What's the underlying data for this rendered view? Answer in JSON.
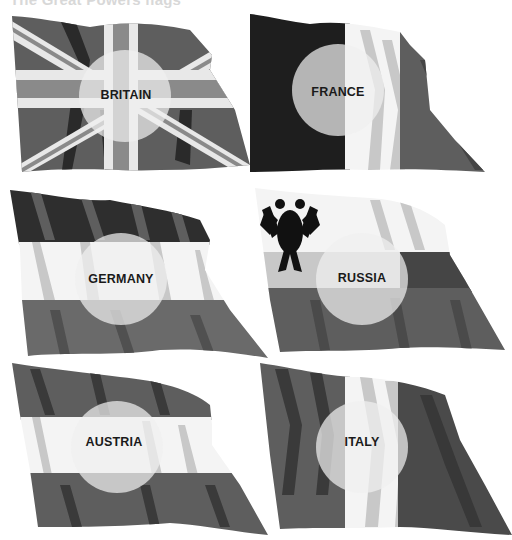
{
  "heading": "The Great Powers flags",
  "colors": {
    "dark": "#2a2a2a",
    "mid": "#5e5e5e",
    "light": "#c8c8c8",
    "white": "#ffffff",
    "circle": "rgba(235,235,235,0.78)",
    "label": "#1a1a1a"
  },
  "flags": [
    {
      "id": "britain",
      "label": "BRITAIN"
    },
    {
      "id": "france",
      "label": "FRANCE"
    },
    {
      "id": "germany",
      "label": "GERMANY"
    },
    {
      "id": "russia",
      "label": "RUSSIA"
    },
    {
      "id": "austria",
      "label": "AUSTRIA"
    },
    {
      "id": "italy",
      "label": "ITALY"
    }
  ]
}
